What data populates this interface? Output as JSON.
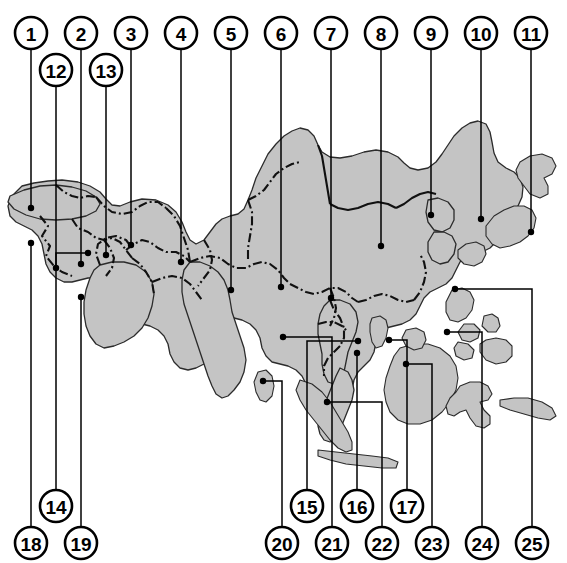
{
  "figure": {
    "kind": "labelled-reference-map",
    "region": "Asia",
    "background_color": "#ffffff",
    "land_fill_color": "#c4c4c4",
    "land_outline_color": "#2b2b2b",
    "border_line_color": "#111111",
    "leader_line_color": "#000000",
    "callout_fill_color": "#ffffff",
    "callout_text_color": "#000000"
  },
  "callouts": {
    "top_row_1": [
      {
        "id": "1",
        "label": "1",
        "cx": 31,
        "cy": 33,
        "leader_x": 31,
        "leader_y": 208
      },
      {
        "id": "2",
        "label": "2",
        "cx": 81,
        "cy": 33,
        "leader_x": 81,
        "leader_y": 264
      },
      {
        "id": "3",
        "label": "3",
        "cx": 131,
        "cy": 33,
        "leader_x": 131,
        "leader_y": 245
      },
      {
        "id": "4",
        "label": "4",
        "cx": 181,
        "cy": 33,
        "leader_x": 181,
        "leader_y": 262
      },
      {
        "id": "5",
        "label": "5",
        "cx": 231,
        "cy": 33,
        "leader_x": 231,
        "leader_y": 290
      },
      {
        "id": "6",
        "label": "6",
        "cx": 281,
        "cy": 33,
        "leader_x": 281,
        "leader_y": 287
      },
      {
        "id": "7",
        "label": "7",
        "cx": 331,
        "cy": 33,
        "leader_x": 331,
        "leader_y": 298
      },
      {
        "id": "8",
        "label": "8",
        "cx": 381,
        "cy": 33,
        "leader_x": 381,
        "leader_y": 246
      },
      {
        "id": "9",
        "label": "9",
        "cx": 431,
        "cy": 33,
        "leader_x": 431,
        "leader_y": 215
      },
      {
        "id": "10",
        "label": "10",
        "cx": 481,
        "cy": 33,
        "leader_x": 481,
        "leader_y": 219
      },
      {
        "id": "11",
        "label": "11",
        "cx": 531,
        "cy": 33,
        "leader_x": 531,
        "leader_y": 232
      }
    ],
    "top_row_2": [
      {
        "id": "12",
        "label": "12",
        "cx": 56,
        "cy": 70,
        "leader_x": 56,
        "leader_y": 268
      },
      {
        "id": "13",
        "label": "13",
        "cx": 106,
        "cy": 70,
        "leader_x": 106,
        "leader_y": 255
      }
    ],
    "bottom_row_1": [
      {
        "id": "14",
        "label": "14",
        "cx": 56,
        "cy": 506
      },
      {
        "id": "15",
        "label": "15",
        "cx": 307,
        "cy": 506
      },
      {
        "id": "16",
        "label": "16",
        "cx": 357,
        "cy": 506
      },
      {
        "id": "17",
        "label": "17",
        "cx": 407,
        "cy": 506
      }
    ],
    "bottom_row_2": [
      {
        "id": "18",
        "label": "18",
        "cx": 31,
        "cy": 543
      },
      {
        "id": "19",
        "label": "19",
        "cx": 81,
        "cy": 543
      },
      {
        "id": "20",
        "label": "20",
        "cx": 282,
        "cy": 543
      },
      {
        "id": "21",
        "label": "21",
        "cx": 332,
        "cy": 543
      },
      {
        "id": "22",
        "label": "22",
        "cx": 382,
        "cy": 543
      },
      {
        "id": "23",
        "label": "23",
        "cx": 432,
        "cy": 543
      },
      {
        "id": "24",
        "label": "24",
        "cx": 482,
        "cy": 543
      },
      {
        "id": "25",
        "label": "25",
        "cx": 532,
        "cy": 543
      }
    ]
  },
  "leader_paths": {
    "n1": "M31,49 L31,208",
    "n2": "M81,49 L81,264",
    "n3": "M131,49 L131,245",
    "n4": "M181,49 L181,262",
    "n5": "M231,49 L231,290",
    "n6": "M281,49 L281,287",
    "n7": "M331,49 L331,298",
    "n8": "M381,49 L381,246",
    "n9": "M431,49 L431,215",
    "n10": "M481,49 L481,219",
    "n11": "M531,49 L531,232",
    "n12": "M56,86 L56,268",
    "n13": "M106,86 L106,255",
    "n14": "M56,490 L56,253 L88,253",
    "n15": "M307,490 L307,341 L358,341",
    "n16": "M357,490 L357,353",
    "n17": "M407,490 L407,340 L389,340",
    "n18": "M31,527 L31,243",
    "n19": "M81,527 L81,297",
    "n20": "M282,527 L282,381 L263,381",
    "n21": "M332,527 L332,337 L283,337",
    "n22": "M382,527 L382,402 L327,402",
    "n23": "M432,527 L432,364 L406,364",
    "n24": "M482,527 L482,332 L447,332",
    "n25": "M532,527 L532,289 L455,289"
  },
  "leader_dots": [
    {
      "for": "1",
      "x": 31,
      "y": 208
    },
    {
      "for": "2",
      "x": 81,
      "y": 264
    },
    {
      "for": "3",
      "x": 131,
      "y": 245
    },
    {
      "for": "4",
      "x": 181,
      "y": 262
    },
    {
      "for": "5",
      "x": 231,
      "y": 290
    },
    {
      "for": "6",
      "x": 281,
      "y": 287
    },
    {
      "for": "7",
      "x": 331,
      "y": 298
    },
    {
      "for": "8",
      "x": 381,
      "y": 246
    },
    {
      "for": "9",
      "x": 431,
      "y": 215
    },
    {
      "for": "10",
      "x": 481,
      "y": 219
    },
    {
      "for": "11",
      "x": 531,
      "y": 232
    },
    {
      "for": "12",
      "x": 56,
      "y": 268
    },
    {
      "for": "13",
      "x": 106,
      "y": 255
    },
    {
      "for": "14",
      "x": 88,
      "y": 253
    },
    {
      "for": "15",
      "x": 358,
      "y": 341
    },
    {
      "for": "16",
      "x": 357,
      "y": 353
    },
    {
      "for": "17",
      "x": 389,
      "y": 340
    },
    {
      "for": "18",
      "x": 31,
      "y": 243
    },
    {
      "for": "19",
      "x": 81,
      "y": 297
    },
    {
      "for": "20",
      "x": 263,
      "y": 381
    },
    {
      "for": "21",
      "x": 283,
      "y": 337
    },
    {
      "for": "22",
      "x": 327,
      "y": 402
    },
    {
      "for": "23",
      "x": 406,
      "y": 364
    },
    {
      "for": "24",
      "x": 447,
      "y": 332
    },
    {
      "for": "25",
      "x": 455,
      "y": 289
    }
  ],
  "geometry": {
    "mainland": "M12,196 L22,186 L34,183 L48,181 L62,180 L78,182 L90,186 L100,192 L106,199 L112,205 L120,206 L130,202 L142,199 L156,200 L168,205 L176,212 L182,222 L186,232 L190,240 L196,244 L204,240 L210,232 L216,224 L222,219 L230,216 L238,214 L244,209 L248,200 L252,190 L256,178 L262,166 L268,154 L276,144 L284,136 L292,131 L300,128 L308,130 L314,136 L318,145 L322,152 L330,157 L340,158 L352,156 L364,152 L376,150 L388,152 L398,157 L404,163 L410,168 L418,170 L428,168 L436,162 L442,154 L448,145 L454,136 L462,128 L470,123 L478,121 L486,124 L490,132 L492,142 L494,153 L498,162 L506,168 L514,172 L520,178 L523,187 L522,197 L518,206 L512,213 L506,219 L502,226 L500,234 L496,242 L490,248 L482,252 L474,254 L466,256 L460,262 L456,270 L452,278 L446,284 L438,288 L430,292 L424,298 L420,306 L416,314 L410,320 L402,324 L394,326 L386,328 L380,334 L376,342 L374,352 L370,360 L364,366 L358,372 L354,380 L352,390 L348,398 L342,404 L334,408 L326,410 L318,408 L312,402 L308,394 L306,384 L302,376 L296,370 L288,366 L280,364 L272,362 L266,356 L262,348 L260,338 L256,330 L250,324 L242,320 L234,318 L228,322 L224,330 L222,340 L218,350 L212,358 L204,364 L196,368 L188,370 L180,368 L174,362 L170,354 L168,344 L164,336 L158,330 L150,326 L142,324 L134,322 L128,316 L124,308 L122,298 L118,290 L112,284 L104,280 L96,278 L88,278 L80,280 L72,282 L64,282 L56,278 L50,272 L46,264 L44,254 L42,244 L38,236 L32,230 L24,226 L16,222 L10,216 L8,206 Z",
    "india": "M190,262 L200,262 L210,266 L218,272 L224,280 L228,290 L230,300 L232,312 L236,324 L240,336 L244,348 L246,360 L244,372 L240,382 L234,390 L228,396 L222,398 L216,394 L212,386 L208,376 L204,364 L200,352 L196,340 L192,328 L188,316 L184,304 L182,292 L182,280 L184,270 Z",
    "arabia": "M100,265 L112,262 L124,262 L136,265 L146,272 L152,282 L154,294 L152,306 L148,318 L142,328 L134,336 L124,342 L114,346 L104,348 L96,344 L90,336 L86,326 L84,314 L84,302 L86,290 L90,278 L94,270 Z",
    "turkey": "M10,196 L24,190 L40,186 L56,185 L72,187 L86,191 L96,197 L100,204 L96,211 L86,216 L72,219 L56,220 L40,219 L26,215 L14,209 L8,202 Z",
    "indochina_peninsula": "M330,300 L340,300 L350,304 L356,312 L358,322 L356,332 L352,342 L348,352 L346,362 L344,372 L340,380 L334,384 L328,382 L324,374 L322,364 L322,354 L320,344 L318,334 L318,324 L320,314 L324,306 Z",
    "malay_peninsula": "M340,368 L348,372 L352,380 L354,390 L352,400 L348,410 L344,420 L340,430 L336,438 L330,442 L324,440 L320,434 L318,426 L320,416 L324,406 L328,396 L332,386 L336,376 Z",
    "sumatra": "M300,380 L312,384 L322,392 L330,402 L336,412 L342,422 L348,432 L352,442 L352,450 L346,452 L338,448 L330,440 L322,430 L314,420 L306,410 L300,400 L296,390 Z",
    "java": "M318,450 L336,452 L354,454 L372,456 L388,458 L398,462 L396,468 L382,468 L364,466 L346,464 L330,460 L318,456 Z",
    "borneo": "M400,348 L414,344 L428,344 L440,348 L450,356 L456,366 L458,378 L456,390 L450,402 L442,412 L432,420 L420,424 L408,424 L398,420 L390,412 L386,402 L384,390 L386,378 L390,366 L394,356 Z",
    "sulawesi": "M460,386 L470,382 L480,382 L488,386 L492,394 L488,400 L480,402 L484,410 L490,416 L490,424 L484,428 L476,426 L470,418 L466,410 L460,412 L454,416 L448,414 L446,406 L450,398 L456,392 Z",
    "philippines_1": "M452,290 L462,288 L470,292 L474,300 L472,310 L466,318 L458,322 L450,320 L446,312 L446,302 Z",
    "philippines_2": "M464,324 L474,324 L480,330 L478,338 L470,342 L462,340 L458,332 Z",
    "philippines_3": "M484,316 L492,314 L498,318 L500,326 L496,332 L488,332 L482,326 Z",
    "philippines_4": "M458,342 L468,344 L474,350 L472,358 L464,360 L456,356 L454,348 Z",
    "philippines_5": "M486,340 L496,338 L506,340 L512,346 L512,356 L506,362 L496,364 L486,360 L480,352 L480,344 Z",
    "taiwan": "M372,318 L380,316 L386,320 L388,328 L386,338 L382,346 L376,348 L372,342 L370,332 L370,324 Z",
    "korea_n": "M428,200 L438,198 L448,202 L454,210 L454,220 L450,228 L442,232 L434,230 L428,222 L426,212 Z",
    "korea_s": "M434,232 L444,232 L452,236 L456,244 L454,254 L448,262 L440,264 L432,260 L428,252 L428,242 Z",
    "japan_n": "M520,162 L530,156 L542,154 L552,158 L556,166 L552,174 L544,178 L548,186 L548,194 L540,198 L530,194 L524,186 L518,178 L516,170 Z",
    "japan_s": "M494,216 L504,210 L514,206 L524,206 L532,210 L536,218 L534,228 L528,236 L520,242 L510,246 L500,248 L492,244 L486,236 L486,226 Z",
    "japan_sw": "M466,244 L476,242 L484,246 L486,254 L482,262 L474,266 L464,264 L458,258 L458,250 Z",
    "sri_lanka": "M258,372 L266,370 L272,376 L274,386 L272,396 L266,402 L260,400 L256,392 L254,382 Z",
    "hainan": "M406,330 L416,328 L424,332 L426,340 L422,348 L414,350 L406,346 L402,338 Z",
    "new_guinea_w": "M500,400 L514,398 L528,398 L542,402 L552,408 L556,416 L550,420 L538,418 L524,414 L510,410 L500,406 Z"
  },
  "internal_borders": {
    "b1": "M40,216 L48,226 L42,236 L50,246 L46,256 L54,266 L62,272 L72,276",
    "b2": "M72,219 L78,228 L88,232 L96,238 L104,240 L112,238 L120,242 L126,250 L132,258",
    "b3": "M96,197 L104,206 L112,212 L122,214 L132,212 L140,206 L148,202 L158,202 L166,208",
    "b4": "M126,250 L134,244 L142,240 L150,242 L158,248 L166,252 L176,252 L184,256 L190,262",
    "b5": "M100,265 L96,254 L98,244 L106,238 L116,236 L126,240 L132,248",
    "b6": "M132,258 L140,264 L146,272 L152,282 L154,294",
    "b7": "M152,282 L162,278 L172,276 L182,278 L190,284 L196,292 L202,300",
    "b8": "M166,208 L174,216 L180,226 L184,238 L188,250 L190,262",
    "b9": "M190,262 L200,258 L210,256 L220,258 L228,264 L236,268 L246,268 L254,264 L262,262 L270,264 L278,270 L284,278 L290,284",
    "b10": "M204,240 L210,250 L212,260 L210,270 L204,278 L198,286",
    "b11": "M248,200 L252,212 L252,224 L250,236 L248,248 L248,260",
    "b12": "M290,284 L298,288 L306,292 L314,294 L322,292 L330,288 L338,288 L346,292 L352,298 L358,302",
    "b13": "M358,302 L366,300 L374,296 L382,294 L390,296 L398,300 L406,302 L414,300",
    "b14": "M414,300 L420,292 L424,282 L426,272 L424,262 L420,254",
    "b15": "M318,145 L322,156 L324,168 L326,180 L328,192 L330,204",
    "b16": "M330,204 L338,208 L348,210 L358,208 L368,204 L378,202 L388,204 L396,208",
    "b17": "M396,208 L404,204 L412,198 L420,194 L428,192 L436,194",
    "b18": "M248,200 L256,196 L264,190 L270,182 L276,174 L284,168 L292,164 L300,162",
    "b19": "M330,300 L334,310 L340,318 L344,328 L344,338 L340,346",
    "b20": "M340,346 L334,352 L328,358 L324,366 L324,376",
    "b21": "M318,324 L326,322 L334,322 L342,326 L348,332",
    "b22": "M330,288 L334,298 L336,308 L334,318 L330,326",
    "b23": "M56,185 L64,192 L72,196 L80,198 L88,196 L96,197",
    "b24": "M104,240 L110,248 L114,258 L112,268 L106,276"
  }
}
